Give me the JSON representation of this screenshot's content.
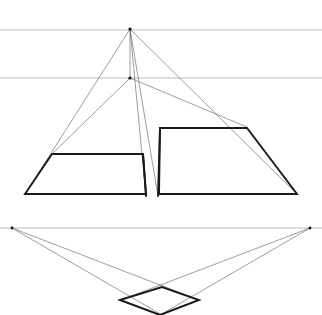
{
  "document": {
    "title": "Two-Point Perspective Construction",
    "canvas_width": 322,
    "canvas_height": 315,
    "background_color": "#ffffff"
  },
  "palette": {
    "guide_gray": "#9a9a9a",
    "horizon_gray": "#a8a8a8",
    "construction_gray": "#5c5c5c",
    "object_black": "#1a1a1a"
  },
  "chart_data": {
    "type": "line",
    "xlabel": "",
    "ylabel": "",
    "xlim": [
      0,
      322
    ],
    "ylim": [
      0,
      315
    ],
    "grid": false,
    "legend": "none",
    "series": [
      {
        "name": "upper-horizon-line",
        "style": "horizon",
        "points": [
          [
            0,
            30
          ],
          [
            322,
            30
          ]
        ]
      },
      {
        "name": "lower-horizon-line",
        "style": "horizon",
        "points": [
          [
            0,
            78
          ],
          [
            322,
            78
          ]
        ]
      },
      {
        "name": "plan-horizon-line",
        "style": "horizon",
        "points": [
          [
            0,
            228
          ],
          [
            322,
            228
          ]
        ]
      },
      {
        "name": "vertical-measuring-line",
        "style": "construction",
        "points": [
          [
            130,
            29
          ],
          [
            130,
            78
          ]
        ]
      },
      {
        "name": "ray-apex-to-left-base",
        "style": "construction",
        "points": [
          [
            130,
            29
          ],
          [
            25,
            194
          ]
        ]
      },
      {
        "name": "ray-apex-to-right-base",
        "style": "construction",
        "points": [
          [
            130,
            29
          ],
          [
            297,
            194
          ]
        ]
      },
      {
        "name": "ray-apex-to-center-left",
        "style": "construction",
        "points": [
          [
            130,
            29
          ],
          [
            146,
            196
          ]
        ]
      },
      {
        "name": "ray-apex-to-center-right",
        "style": "construction",
        "points": [
          [
            130,
            29
          ],
          [
            158,
            196
          ]
        ]
      },
      {
        "name": "ray-node-to-left-panel-top",
        "style": "construction",
        "points": [
          [
            130,
            78
          ],
          [
            52,
            154
          ]
        ]
      },
      {
        "name": "ray-node-to-right-panel-top",
        "style": "construction",
        "points": [
          [
            130,
            78
          ],
          [
            247,
            127
          ]
        ]
      },
      {
        "name": "left-panel-quad",
        "style": "object",
        "closed": true,
        "points": [
          [
            52,
            154
          ],
          [
            143,
            154
          ],
          [
            146,
            194
          ],
          [
            25,
            194
          ]
        ]
      },
      {
        "name": "right-panel-quad",
        "style": "object",
        "closed": true,
        "points": [
          [
            160,
            128
          ],
          [
            247,
            128
          ],
          [
            297,
            194
          ],
          [
            159,
            194
          ]
        ]
      },
      {
        "name": "center-spine-left",
        "style": "object",
        "points": [
          [
            143,
            154
          ],
          [
            146,
            196
          ]
        ]
      },
      {
        "name": "center-spine-right",
        "style": "object",
        "points": [
          [
            160,
            128
          ],
          [
            158,
            196
          ]
        ]
      },
      {
        "name": "plan-left-vanishing-ray-outer",
        "style": "construction",
        "points": [
          [
            12,
            228
          ],
          [
            162,
            315
          ]
        ]
      },
      {
        "name": "plan-left-vanishing-ray-inner",
        "style": "construction",
        "points": [
          [
            12,
            228
          ],
          [
            199,
            300
          ]
        ]
      },
      {
        "name": "plan-right-vanishing-ray-outer",
        "style": "construction",
        "points": [
          [
            310,
            228
          ],
          [
            160,
            315
          ]
        ]
      },
      {
        "name": "plan-right-vanishing-ray-inner",
        "style": "construction",
        "points": [
          [
            310,
            228
          ],
          [
            121,
            300
          ]
        ]
      },
      {
        "name": "plan-diamond",
        "style": "object",
        "closed": true,
        "points": [
          [
            120,
            300
          ],
          [
            162,
            287
          ],
          [
            199,
            300
          ],
          [
            160,
            315
          ]
        ]
      }
    ],
    "vanishing_points": [
      {
        "name": "station-apex",
        "x": 130,
        "y": 29
      },
      {
        "name": "center-node",
        "x": 130,
        "y": 78
      },
      {
        "name": "plan-left-vp",
        "x": 12,
        "y": 228
      },
      {
        "name": "plan-right-vp",
        "x": 310,
        "y": 228
      }
    ]
  }
}
